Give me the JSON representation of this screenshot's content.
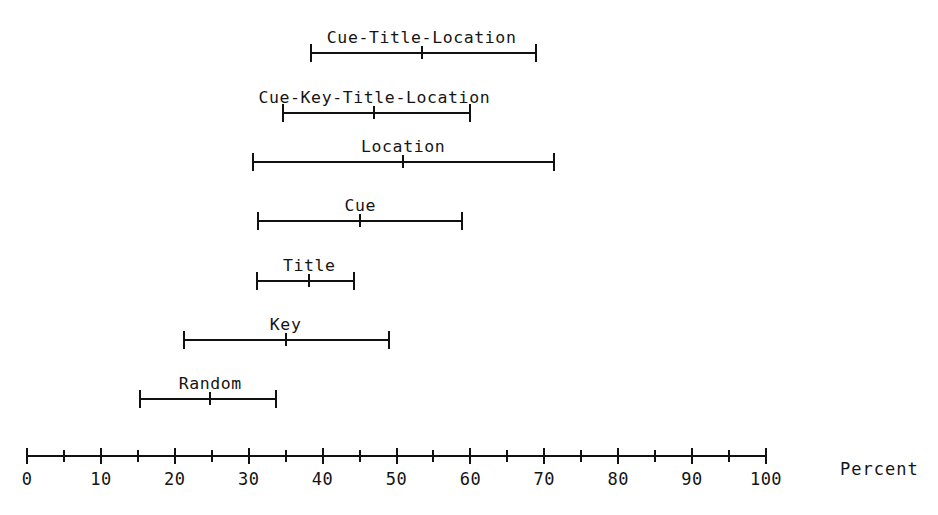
{
  "chart_data": {
    "type": "bar",
    "subtype": "interval-plot",
    "title": "",
    "xlabel": "Percent",
    "ylabel": "",
    "xlim": [
      0,
      100
    ],
    "grid": false,
    "legend": null,
    "axis": {
      "title": "Percent",
      "major_ticks": [
        0,
        10,
        20,
        30,
        40,
        50,
        60,
        70,
        80,
        90,
        100
      ],
      "minor_ticks": [
        5,
        15,
        25,
        35,
        45,
        55,
        65,
        75,
        85,
        95
      ],
      "tick_labels": [
        "0",
        "10",
        "20",
        "30",
        "40",
        "50",
        "60",
        "70",
        "80",
        "90",
        "100"
      ]
    },
    "categories": [
      "Cue-Title-Location",
      "Cue-Key-Title-Location",
      "Location",
      "Cue",
      "Title",
      "Key",
      "Random"
    ],
    "series": [
      {
        "name": "low",
        "values": [
          38.3,
          34.5,
          30.4,
          31.1,
          31.0,
          21.1,
          15.2
        ]
      },
      {
        "name": "mid",
        "values": [
          53.4,
          47.0,
          50.9,
          45.1,
          38.2,
          35.0,
          24.8
        ]
      },
      {
        "name": "high",
        "values": [
          69.0,
          60.1,
          71.4,
          59.0,
          44.4,
          49.1,
          33.8
        ]
      }
    ],
    "intervals": [
      {
        "label": "Cue-Title-Location",
        "low": 38.3,
        "mid": 53.4,
        "high": 69.0
      },
      {
        "label": "Cue-Key-Title-Location",
        "low": 34.5,
        "mid": 47.0,
        "high": 60.1
      },
      {
        "label": "Location",
        "low": 30.4,
        "mid": 50.9,
        "high": 71.4
      },
      {
        "label": "Cue",
        "low": 31.1,
        "mid": 45.1,
        "high": 59.0
      },
      {
        "label": "Title",
        "low": 31.0,
        "mid": 38.2,
        "high": 44.4
      },
      {
        "label": "Key",
        "low": 21.1,
        "mid": 35.0,
        "high": 49.1
      },
      {
        "label": "Random",
        "low": 15.2,
        "mid": 24.8,
        "high": 33.8
      }
    ],
    "colors": {
      "ink": "#111111",
      "background": "#ffffff"
    }
  },
  "layout": {
    "axis_left_px": 27,
    "axis_right_px": 766,
    "row_baselines_px": [
      50,
      110,
      159,
      218,
      278,
      337,
      396
    ],
    "axis_title_left_px": 840
  }
}
